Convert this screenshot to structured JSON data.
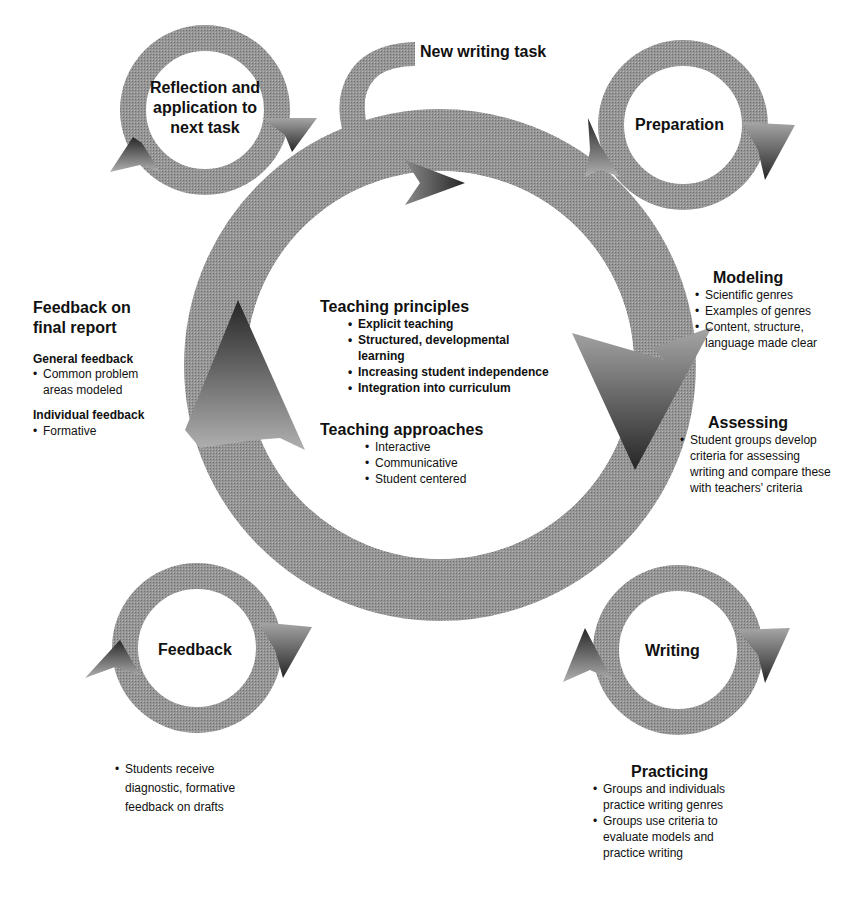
{
  "colors": {
    "ring_gray": "#8c8c8c",
    "ring_light": "#a8a8a8",
    "arrow_dark": "#2a2a2a",
    "text": "#111111",
    "background": "#ffffff"
  },
  "new_task": {
    "label": "New writing task"
  },
  "stages": {
    "reflection": {
      "label_lines": [
        "Reflection and",
        "application to",
        "next task"
      ]
    },
    "preparation": {
      "label": "Preparation"
    },
    "writing": {
      "label": "Writing"
    },
    "feedback": {
      "label": "Feedback"
    }
  },
  "center": {
    "principles": {
      "heading": "Teaching principles",
      "items": [
        "Explicit teaching",
        "Structured, developmental learning",
        "Increasing student independence",
        "Integration into curriculum"
      ]
    },
    "approaches": {
      "heading": "Teaching approaches",
      "items": [
        "Interactive",
        "Communicative",
        "Student centered"
      ]
    }
  },
  "modeling": {
    "heading": "Modeling",
    "items": [
      "Scientific genres",
      "Examples of genres",
      "Content, structure, language made clear"
    ]
  },
  "assessing": {
    "heading": "Assessing",
    "items": [
      "Student groups develop criteria for assessing writing and compare these with teachers' criteria"
    ]
  },
  "practicing": {
    "heading": "Practicing",
    "items": [
      "Groups and individuals practice writing genres",
      "Groups use criteria to evaluate models and practice writing"
    ]
  },
  "feedback_drafts": {
    "items": [
      "Students receive diagnostic, formative feedback on drafts"
    ]
  },
  "final_report": {
    "heading_lines": [
      "Feedback on",
      "final report"
    ],
    "general": {
      "heading": "General feedback",
      "items": [
        "Common problem areas modeled"
      ]
    },
    "individual": {
      "heading": "Individual feedback",
      "items": [
        "Formative"
      ]
    }
  }
}
